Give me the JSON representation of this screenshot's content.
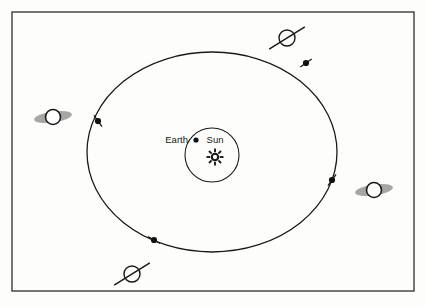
{
  "figure": {
    "background_color": "#fdfdfc",
    "border_color": "#3c3c3c",
    "line_color": "#1a1a1a",
    "ring_color": "#9a9a9a",
    "body_fill": "#ffffff",
    "frame": {
      "x": 12,
      "y": 12,
      "width": 402,
      "height": 279
    }
  },
  "labels": {
    "earth": "Earth",
    "sun": "Sun"
  },
  "sun": {
    "center_x": 215,
    "center_y": 157,
    "ray_count": 8,
    "core_radius": 3.2,
    "ray_outer": 8.5
  },
  "earth": {
    "center_x": 196,
    "center_y": 140,
    "radius": 2.6
  },
  "inner_orbit": {
    "center_x": 212,
    "center_y": 155,
    "radius": 27
  },
  "outer_orbit": {
    "center_x": 212,
    "center_y": 152,
    "rx": 125,
    "ry": 100
  },
  "orbit_markers": [
    {
      "name": "marker-upper-right",
      "x": 306,
      "y": 63,
      "tick_angle": -35
    },
    {
      "name": "marker-left",
      "x": 98,
      "y": 121,
      "tick_angle": 55
    },
    {
      "name": "marker-lower-right",
      "x": 332,
      "y": 180,
      "tick_angle": -55
    },
    {
      "name": "marker-lower-left",
      "x": 154,
      "y": 240,
      "tick_angle": 30
    }
  ],
  "planets": [
    {
      "name": "planet-left-open-rings",
      "ring_view": "open",
      "center_x": 53,
      "center_y": 117,
      "body_radius": 7.5,
      "ring_rx": 19,
      "ring_ry": 5.5,
      "ring_rotation": -8
    },
    {
      "name": "planet-right-open-rings",
      "ring_view": "open",
      "center_x": 374,
      "center_y": 190,
      "body_radius": 7.5,
      "ring_rx": 19,
      "ring_ry": 5.5,
      "ring_rotation": -8
    },
    {
      "name": "planet-top-edge-on-rings",
      "ring_view": "edge-on",
      "center_x": 287,
      "center_y": 38,
      "body_radius": 8,
      "ring_half_length": 21,
      "ring_rotation": -32
    },
    {
      "name": "planet-bottom-edge-on-rings",
      "ring_view": "edge-on",
      "center_x": 132,
      "center_y": 274,
      "body_radius": 8,
      "ring_half_length": 21,
      "ring_rotation": -32
    }
  ],
  "text_positions": {
    "earth_label_x": 188,
    "earth_label_y": 143,
    "sun_label_x": 215,
    "sun_label_y": 143
  }
}
